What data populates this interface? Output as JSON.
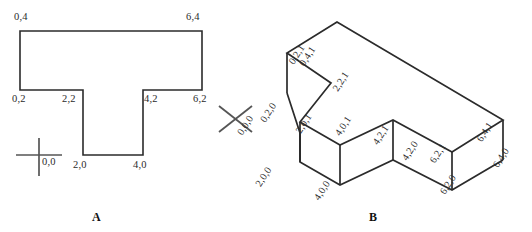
{
  "figure_a": {
    "name": "A",
    "caption": "A",
    "crosshair": {
      "icon": "plus-crosshair-icon",
      "label": "0,0"
    },
    "vertex_labels": [
      {
        "text": "0,4",
        "x": 14,
        "y": 12
      },
      {
        "text": "6,4",
        "x": 186,
        "y": 12
      },
      {
        "text": "0,2",
        "x": 12,
        "y": 94
      },
      {
        "text": "2,2",
        "x": 62,
        "y": 94
      },
      {
        "text": "4,2",
        "x": 144,
        "y": 94
      },
      {
        "text": "6,2",
        "x": 193,
        "y": 94
      },
      {
        "text": "2,0",
        "x": 73,
        "y": 160
      },
      {
        "text": "4,0",
        "x": 133,
        "y": 160
      }
    ],
    "outline_points": "20,31 202,31 202,90 143,90 143,155 83,155 83,90 20,90"
  },
  "figure_b": {
    "name": "B",
    "caption": "B",
    "crosshair": {
      "icon": "x-crosshair-icon",
      "label": "0,0,0"
    },
    "vertex_labels": [
      {
        "text": "0,4,1",
        "x": 331,
        "y": 22
      },
      {
        "text": "0,2,1",
        "x": 293,
        "y": 55
      },
      {
        "text": "2,2,1",
        "x": 337,
        "y": 82
      },
      {
        "text": "0,2,0",
        "x": 272,
        "y": 94
      },
      {
        "text": "2,0,1",
        "x": 300,
        "y": 124
      },
      {
        "text": "4,0,1",
        "x": 330,
        "y": 130
      },
      {
        "text": "4,2,1",
        "x": 389,
        "y": 117
      },
      {
        "text": "6,2,1",
        "x": 445,
        "y": 137
      },
      {
        "text": "6,4,1",
        "x": 493,
        "y": 114
      },
      {
        "text": "2,0,0",
        "x": 263,
        "y": 165
      },
      {
        "text": "4,0,0",
        "x": 311,
        "y": 191
      },
      {
        "text": "4,2,0",
        "x": 398,
        "y": 153
      },
      {
        "text": "6,2,0",
        "x": 437,
        "y": 185
      },
      {
        "text": "6,4,0",
        "x": 489,
        "y": 160
      }
    ],
    "top_face_points": "337,22 287,53 331,83 300,122 340,145 393,120 452,152 503,120",
    "front_edges": [
      {
        "from": "287,53",
        "to": "287,93"
      },
      {
        "from": "300,122",
        "to": "300,162"
      },
      {
        "from": "393,120",
        "to": "393,152"
      },
      {
        "from": "452,152",
        "to": "452,190"
      },
      {
        "from": "503,120",
        "to": "503,160"
      }
    ],
    "bottom_points": "287,93 300,133 300,162 340,185 393,160 452,190 503,160"
  },
  "style": {
    "line_color": "#2b2b2b",
    "background": "#ffffff",
    "text_color": "#2b2b2b"
  }
}
